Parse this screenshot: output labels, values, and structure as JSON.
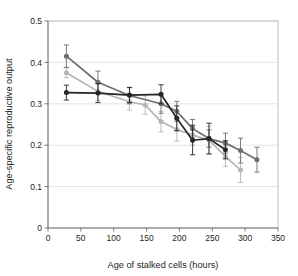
{
  "chart_data": {
    "type": "line",
    "title": "",
    "xlabel": "Age of stalked cells (hours)",
    "ylabel": "Age-specific reproductive output",
    "xlim": [
      0,
      350
    ],
    "ylim": [
      0,
      0.5
    ],
    "xticks": [
      0,
      50,
      100,
      150,
      200,
      250,
      300,
      350
    ],
    "xtick_labels": [
      "0",
      "50",
      "100",
      "150",
      "200",
      "250",
      "300",
      "350"
    ],
    "yticks": [
      0,
      0.1,
      0.2,
      0.3,
      0.4,
      0.5
    ],
    "ytick_labels": [
      "0",
      "0.1",
      "0.2",
      "0.3",
      "0.4",
      "0.5"
    ],
    "grid": "horizontal",
    "legend": "none",
    "error_bars": "vertical",
    "series": [
      {
        "name": "dark-gray-series",
        "color": "#6e6e6e",
        "marker": "circle",
        "x": [
          28,
          76,
          124,
          172,
          196,
          220,
          245,
          270,
          293,
          318
        ],
        "y": [
          0.415,
          0.352,
          0.32,
          0.3,
          0.282,
          0.24,
          0.216,
          0.205,
          0.187,
          0.165
        ],
        "yerr_low": [
          0.027,
          0.027,
          0.02,
          0.023,
          0.024,
          0.022,
          0.021,
          0.024,
          0.03,
          0.03
        ],
        "yerr_high": [
          0.027,
          0.027,
          0.02,
          0.023,
          0.024,
          0.022,
          0.021,
          0.024,
          0.03,
          0.03
        ]
      },
      {
        "name": "light-gray-series",
        "color": "#b5b5b5",
        "marker": "circle",
        "x": [
          28,
          76,
          124,
          148,
          172,
          196,
          220,
          245,
          270,
          293
        ],
        "y": [
          0.375,
          0.33,
          0.305,
          0.297,
          0.257,
          0.238,
          0.225,
          0.212,
          0.173,
          0.14
        ],
        "yerr_low": [
          0.012,
          0.022,
          0.02,
          0.022,
          0.025,
          0.028,
          0.025,
          0.034,
          0.024,
          0.03
        ],
        "yerr_high": [
          0.012,
          0.022,
          0.02,
          0.022,
          0.025,
          0.028,
          0.025,
          0.034,
          0.024,
          0.03
        ]
      },
      {
        "name": "black-series",
        "color": "#262626",
        "marker": "circle",
        "x": [
          28,
          76,
          124,
          172,
          196,
          220,
          245,
          270
        ],
        "y": [
          0.327,
          0.326,
          0.321,
          0.323,
          0.265,
          0.212,
          0.216,
          0.189
        ],
        "yerr_low": [
          0.018,
          0.023,
          0.018,
          0.023,
          0.03,
          0.035,
          0.037,
          0.022
        ],
        "yerr_high": [
          0.018,
          0.023,
          0.018,
          0.023,
          0.03,
          0.035,
          0.037,
          0.022
        ]
      }
    ]
  },
  "axes": {
    "x_title": "Age of stalked cells (hours)",
    "y_title": "Age-specific reproductive output"
  },
  "colors": {
    "dark_gray": "#6e6e6e",
    "light_gray": "#b5b5b5",
    "black": "#262626",
    "gridline": "#d9d9d9",
    "frame": "#b3b3b3",
    "axis": "#6d6d6d",
    "text": "#231f20",
    "background": "#ffffff"
  }
}
